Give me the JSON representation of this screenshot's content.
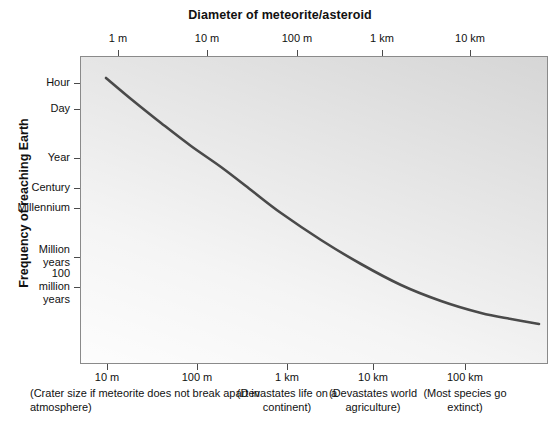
{
  "chart_data": {
    "type": "line",
    "title": "Diameter of meteorite/asteroid",
    "xlabel": "",
    "ylabel": "Frequency of reaching Earth",
    "top_axis": {
      "name": "Diameter of meteorite/asteroid",
      "ticks": [
        {
          "label": "1 m",
          "x": 118
        },
        {
          "label": "10 m",
          "x": 207
        },
        {
          "label": "100 m",
          "x": 297
        },
        {
          "label": "1 km",
          "x": 382
        },
        {
          "label": "10 km",
          "x": 470
        }
      ]
    },
    "bottom_axis": {
      "name": "Crater diameter",
      "ticks": [
        {
          "label": "10 m",
          "x": 107
        },
        {
          "label": "100 m",
          "x": 197
        },
        {
          "label": "1 km",
          "x": 287
        },
        {
          "label": "10 km",
          "x": 373
        },
        {
          "label": "100 km",
          "x": 465
        }
      ]
    },
    "y_axis": {
      "name": "Frequency of reaching Earth",
      "ticks": [
        {
          "label": "Hour",
          "y": 83,
          "lines": [
            "Hour"
          ]
        },
        {
          "label": "Day",
          "y": 109,
          "lines": [
            "Day"
          ]
        },
        {
          "label": "Year",
          "y": 158,
          "lines": [
            "Year"
          ]
        },
        {
          "label": "Century",
          "y": 188,
          "lines": [
            "Century"
          ]
        },
        {
          "label": "Millennium",
          "y": 208,
          "lines": [
            "Millennium"
          ]
        },
        {
          "label": "Million years",
          "y": 257,
          "lines": [
            "Million",
            "years"
          ]
        },
        {
          "label": "100 million years",
          "y": 287,
          "lines": [
            "100",
            "million",
            "years"
          ]
        }
      ]
    },
    "annotations": [
      {
        "text": "(Crater size if meteorite does not break apart in atmosphere)",
        "x": 30,
        "align": "left"
      },
      {
        "text": "(Devastates life on a continent)",
        "x": 287,
        "align": "center"
      },
      {
        "text": "(Devastates world agriculture)",
        "x": 373,
        "align": "center"
      },
      {
        "text": "(Most species go extinct)",
        "x": 465,
        "align": "center"
      }
    ],
    "series": [
      {
        "name": "Frequency vs diameter",
        "color": "#4a4a4a",
        "points": [
          {
            "x": 105,
            "y": 77
          },
          {
            "x": 130,
            "y": 98
          },
          {
            "x": 160,
            "y": 122
          },
          {
            "x": 190,
            "y": 145
          },
          {
            "x": 220,
            "y": 166
          },
          {
            "x": 250,
            "y": 189
          },
          {
            "x": 280,
            "y": 212
          },
          {
            "x": 320,
            "y": 239
          },
          {
            "x": 360,
            "y": 263
          },
          {
            "x": 400,
            "y": 284
          },
          {
            "x": 440,
            "y": 300
          },
          {
            "x": 480,
            "y": 312
          },
          {
            "x": 510,
            "y": 318
          },
          {
            "x": 538,
            "y": 323
          }
        ]
      }
    ],
    "plot_area": {
      "left": 80,
      "top": 56,
      "width": 468,
      "height": 308
    },
    "grid": false,
    "legend": "none",
    "background_color": "#d6d6d6",
    "frame_color": "#8a8a8a",
    "curve_color": "#4a4a4a",
    "reading": "Frequency of Earth impact decreases monotonically from about once per hour for 1 m meteorites to roughly once per 100 million years for objects tens of kilometres across."
  }
}
